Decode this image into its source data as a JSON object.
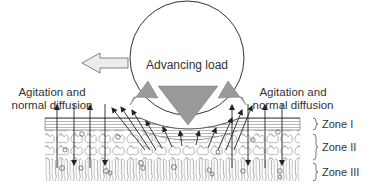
{
  "diagram": {
    "type": "cartilage-load-diffusion-schematic",
    "center_label": "Advancing load",
    "left_label": {
      "line1": "Agitation and",
      "line2": "normal diffusion"
    },
    "right_label": {
      "line1": "Agitation and",
      "line2": "normal diffusion"
    },
    "zones": [
      {
        "id": "zone-1",
        "label": "Zone I"
      },
      {
        "id": "zone-2",
        "label": "Zone II"
      },
      {
        "id": "zone-3",
        "label": "Zone III"
      }
    ],
    "icons": {
      "load_circle": "circle-outline",
      "direction_arrow": "hollow-arrow-left",
      "compression_arrows": "gray-triangle-arrows-down",
      "fluid_flow_arrows": "thin-arrows-outward",
      "diffusion_arrows": "thin-arrows-bidirectional-vertical",
      "zone_brace": "right-curly-brace"
    },
    "colors": {
      "line": "#333333",
      "fill_gray": "#9a9a9a",
      "arrow_fill_light": "#e8e8e8",
      "background": "#ffffff"
    }
  }
}
